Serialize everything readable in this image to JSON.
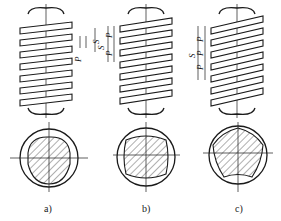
{
  "figure": {
    "panels": [
      {
        "id": "a",
        "caption": "a)",
        "starts": 1,
        "dims": {
          "lead": "S",
          "pitch": "P"
        }
      },
      {
        "id": "b",
        "caption": "b)",
        "starts": 2,
        "dims": {
          "lead": "S",
          "pitch_1": "P",
          "pitch_2": "P"
        }
      },
      {
        "id": "c",
        "caption": "c)",
        "starts": 3,
        "dims": {
          "lead": "S",
          "pitch_1": "P",
          "pitch_2": "P",
          "pitch_3": "P"
        }
      }
    ]
  },
  "colors": {
    "line": "#1a1a1a",
    "background": "#ffffff"
  }
}
